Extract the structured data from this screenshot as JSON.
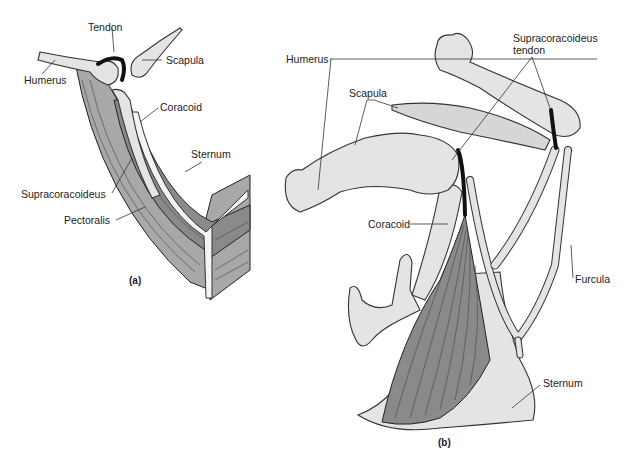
{
  "figure": {
    "panels": [
      {
        "id": "a",
        "caption": "(a)",
        "labels": {
          "tendon": "Tendon",
          "scapula": "Scapula",
          "humerus": "Humerus",
          "coracoid": "Coracoid",
          "sternum": "Sternum",
          "supracoracoideus": "Supracoracoideus",
          "pectoralis": "Pectoralis"
        }
      },
      {
        "id": "b",
        "caption": "(b)",
        "labels": {
          "humerus": "Humerus",
          "scapula": "Scapula",
          "supracoracoideus_tendon_line1": "Supracoracoideus",
          "supracoracoideus_tendon_line2": "tendon",
          "coracoid": "Coracoid",
          "furcula": "Furcula",
          "sternum": "Sternum"
        }
      }
    ],
    "colors": {
      "background": "#ffffff",
      "bone": "#e4e4e4",
      "muscle": "#8a8a8a",
      "tendon": "#111111",
      "outline": "#333333"
    }
  }
}
